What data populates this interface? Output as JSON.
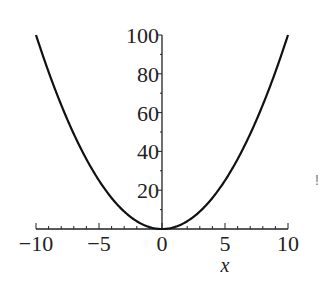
{
  "chart_data": {
    "type": "line",
    "title": "",
    "xlabel": "x",
    "ylabel": "",
    "function": "x^2",
    "xlim": [
      -10,
      10
    ],
    "ylim": [
      0,
      100
    ],
    "x_ticks": [
      -10,
      -5,
      0,
      5,
      10
    ],
    "x_tick_labels": [
      "−10",
      "−5",
      "0",
      "5",
      "10"
    ],
    "y_ticks": [
      20,
      40,
      60,
      80,
      100
    ],
    "y_tick_labels": [
      "20",
      "40",
      "60",
      "80",
      "100"
    ],
    "grid": false,
    "legend": null,
    "series": [
      {
        "name": "x^2",
        "color": "#111111",
        "x": [
          -10,
          -9,
          -8,
          -7,
          -6,
          -5,
          -4,
          -3,
          -2,
          -1,
          0,
          1,
          2,
          3,
          4,
          5,
          6,
          7,
          8,
          9,
          10
        ],
        "y": [
          100,
          81,
          64,
          49,
          36,
          25,
          16,
          9,
          4,
          1,
          0,
          1,
          4,
          9,
          16,
          25,
          36,
          49,
          64,
          81,
          100
        ]
      }
    ],
    "annotations": [
      "!"
    ]
  },
  "labels": {
    "x_axis": "x",
    "annotation": "!"
  }
}
